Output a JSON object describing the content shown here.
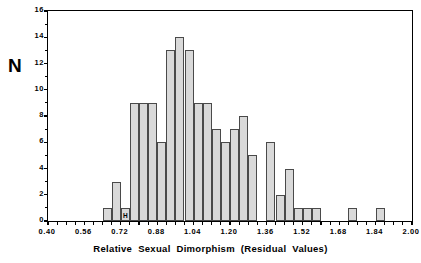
{
  "chart_data": {
    "type": "bar",
    "title": "",
    "xlabel": "Relative  Sexual  Dimorphism  (Residual  Values)",
    "ylabel": "N",
    "xlim": [
      0.4,
      2.0
    ],
    "ylim": [
      0,
      16
    ],
    "xticks": [
      "0.40",
      "0.56",
      "0.72",
      "0.88",
      "1.04",
      "1.20",
      "1.36",
      "1.52",
      "1.68",
      "1.84",
      "2.00"
    ],
    "xtick_values": [
      0.4,
      0.56,
      0.72,
      0.88,
      1.04,
      1.2,
      1.36,
      1.52,
      1.68,
      1.84,
      2.0
    ],
    "xtick_step": 0.16,
    "xminor_per_major": 4,
    "yticks": [
      "0",
      "2",
      "4",
      "6",
      "8",
      "10",
      "12",
      "14",
      "16"
    ],
    "ytick_values": [
      0,
      2,
      4,
      6,
      8,
      10,
      12,
      14,
      16
    ],
    "ytick_step": 2,
    "grid": false,
    "legend": false,
    "bin_width": 0.04,
    "bar_fill": "#d9d9d9",
    "bar_edge": "#4a4a4a",
    "annotations": [
      {
        "text": "H",
        "bin_start": 0.72,
        "value": 1,
        "note": "marker label inside bar at 0.72-0.76"
      }
    ],
    "categories": [
      "0.64-0.68",
      "0.68-0.72",
      "0.72-0.76",
      "0.76-0.80",
      "0.80-0.84",
      "0.84-0.88",
      "0.88-0.92",
      "0.92-0.96",
      "0.96-1.00",
      "1.00-1.04",
      "1.04-1.08",
      "1.08-1.12",
      "1.12-1.16",
      "1.16-1.20",
      "1.20-1.24",
      "1.24-1.28",
      "1.28-1.32",
      "1.32-1.36",
      "1.36-1.40",
      "1.40-1.44",
      "1.44-1.48",
      "1.48-1.52",
      "1.52-1.56",
      "1.72-1.76",
      "1.84-1.88"
    ],
    "bins": [
      {
        "start": 0.64,
        "end": 0.68,
        "value": 1
      },
      {
        "start": 0.68,
        "end": 0.72,
        "value": 3
      },
      {
        "start": 0.72,
        "end": 0.76,
        "value": 1,
        "label": "H"
      },
      {
        "start": 0.76,
        "end": 0.8,
        "value": 9
      },
      {
        "start": 0.8,
        "end": 0.84,
        "value": 9
      },
      {
        "start": 0.84,
        "end": 0.88,
        "value": 9
      },
      {
        "start": 0.88,
        "end": 0.92,
        "value": 6
      },
      {
        "start": 0.92,
        "end": 0.96,
        "value": 13
      },
      {
        "start": 0.96,
        "end": 1.0,
        "value": 14
      },
      {
        "start": 1.0,
        "end": 1.04,
        "value": 13
      },
      {
        "start": 1.04,
        "end": 1.08,
        "value": 9
      },
      {
        "start": 1.08,
        "end": 1.12,
        "value": 9
      },
      {
        "start": 1.12,
        "end": 1.16,
        "value": 7
      },
      {
        "start": 1.16,
        "end": 1.2,
        "value": 6
      },
      {
        "start": 1.2,
        "end": 1.24,
        "value": 7
      },
      {
        "start": 1.24,
        "end": 1.28,
        "value": 8
      },
      {
        "start": 1.28,
        "end": 1.32,
        "value": 5
      },
      {
        "start": 1.36,
        "end": 1.4,
        "value": 6
      },
      {
        "start": 1.4,
        "end": 1.44,
        "value": 2
      },
      {
        "start": 1.44,
        "end": 1.48,
        "value": 4
      },
      {
        "start": 1.48,
        "end": 1.52,
        "value": 1
      },
      {
        "start": 1.52,
        "end": 1.56,
        "value": 1
      },
      {
        "start": 1.56,
        "end": 1.6,
        "value": 1
      },
      {
        "start": 1.72,
        "end": 1.76,
        "value": 1
      },
      {
        "start": 1.84,
        "end": 1.88,
        "value": 1
      }
    ],
    "values": [
      1,
      3,
      1,
      9,
      9,
      9,
      6,
      13,
      14,
      13,
      9,
      9,
      7,
      6,
      7,
      8,
      5,
      6,
      2,
      4,
      1,
      1,
      1,
      1,
      1
    ]
  }
}
